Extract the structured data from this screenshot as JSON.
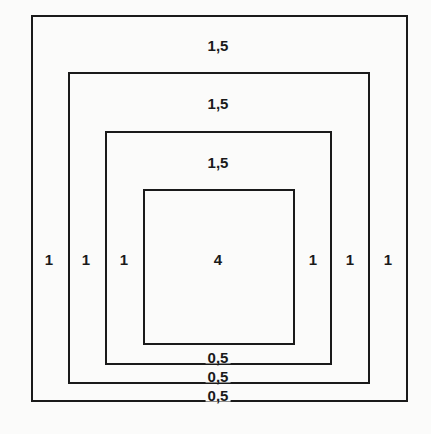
{
  "diagram": {
    "boxes": [
      {
        "name": "outer",
        "left": 31,
        "top": 15,
        "right": 407,
        "bottom": 401
      },
      {
        "name": "second",
        "left": 68,
        "top": 72,
        "right": 369,
        "bottom": 383
      },
      {
        "name": "third",
        "left": 105,
        "top": 131,
        "right": 331,
        "bottom": 364
      },
      {
        "name": "inner",
        "left": 143,
        "top": 189,
        "right": 294,
        "bottom": 344
      }
    ],
    "top_labels": [
      "1,5",
      "1,5",
      "1,5"
    ],
    "left_labels": [
      "1",
      "1",
      "1"
    ],
    "right_labels": [
      "1",
      "1",
      "1"
    ],
    "bottom_labels": [
      "0,5",
      "0,5",
      "0,5"
    ],
    "center_label": "4",
    "line_color": "#1a1a1a",
    "background_color": "#fbfbfa"
  }
}
